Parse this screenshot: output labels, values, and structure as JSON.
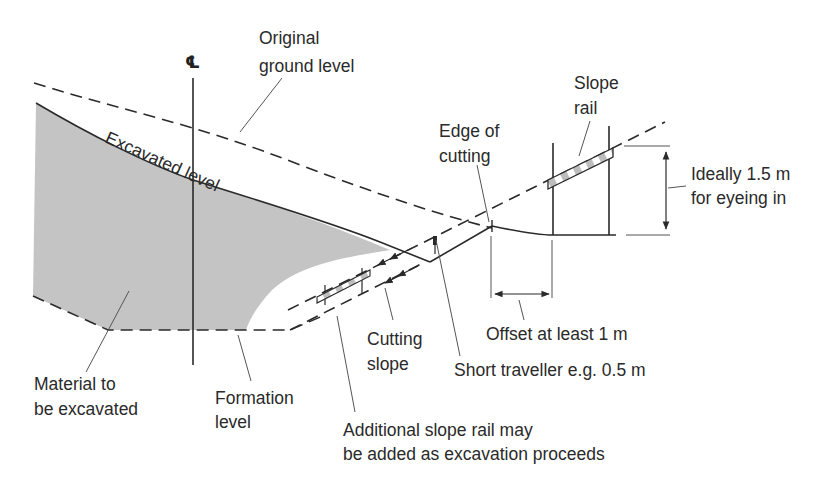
{
  "diagram": {
    "centreline_symbol": "℄",
    "labels": {
      "original_ground": [
        "Original",
        "ground level"
      ],
      "excavated_level": "Excavated level",
      "edge_of_cutting": [
        "Edge of",
        "cutting"
      ],
      "slope_rail": [
        "Slope",
        "rail"
      ],
      "ideal_height": [
        "Ideally 1.5 m",
        "for eyeing in"
      ],
      "offset": "Offset at least 1 m",
      "short_traveller": "Short traveller e.g. 0.5 m",
      "cutting_slope": [
        "Cutting",
        "slope"
      ],
      "material": [
        "Material to",
        "be excavated"
      ],
      "formation_level": [
        "Formation",
        "level"
      ],
      "additional_rail": [
        "Additional slope rail may",
        "be added as excavation proceeds"
      ]
    },
    "colors": {
      "fill_material": "#c4c4c4",
      "line": "#2a2a2a",
      "rail_stripe": "#bdbdbd"
    }
  }
}
